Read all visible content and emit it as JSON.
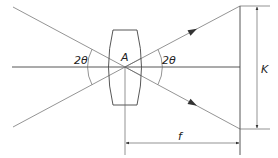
{
  "diagram": {
    "type": "optics-lens-field-of-view",
    "labels": {
      "lens_center": "A",
      "angle_left": "2θ",
      "angle_right": "2θ",
      "image_height": "K",
      "focal_length": "f"
    },
    "colors": {
      "line": "#444444",
      "background": "#ffffff"
    }
  }
}
